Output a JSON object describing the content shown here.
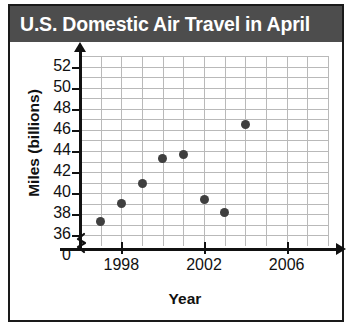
{
  "header": {
    "title": "U.S. Domestic Air Travel in April",
    "band_color": "#4d4d4d",
    "title_color": "#ffffff"
  },
  "axes": {
    "ylabel": "Miles (billions)",
    "xlabel": "Year",
    "y_ticks": [
      "52",
      "50",
      "48",
      "46",
      "44",
      "42",
      "40",
      "38",
      "36",
      "0"
    ],
    "x_ticks": [
      "1998",
      "2002",
      "2006"
    ],
    "y_break": "axis-break-squiggle"
  },
  "chart_data": {
    "type": "scatter",
    "title": "U.S. Domestic Air Travel in April",
    "xlabel": "Year",
    "ylabel": "Miles (billions)",
    "x": [
      1997,
      1998,
      1999,
      2000,
      2001,
      2002,
      2003,
      2004
    ],
    "values": [
      37.3,
      39.0,
      40.9,
      43.3,
      43.7,
      39.4,
      38.2,
      46.5
    ],
    "points": [
      {
        "x": 1997,
        "y": 37.3
      },
      {
        "x": 1998,
        "y": 39.0
      },
      {
        "x": 1999,
        "y": 40.9
      },
      {
        "x": 2000,
        "y": 43.3
      },
      {
        "x": 2001,
        "y": 43.7
      },
      {
        "x": 2002,
        "y": 39.4
      },
      {
        "x": 2003,
        "y": 38.2
      },
      {
        "x": 2004,
        "y": 46.5
      }
    ],
    "xlim": [
      1996,
      2008
    ],
    "ylim": [
      35,
      53
    ],
    "y_tick_values": [
      52,
      50,
      48,
      46,
      44,
      42,
      40,
      38,
      36
    ],
    "x_tick_values": [
      1998,
      2002,
      2006
    ],
    "y_axis_break_at": 0,
    "grid": true,
    "legend": null,
    "marker_color": "#3f3f3f"
  }
}
